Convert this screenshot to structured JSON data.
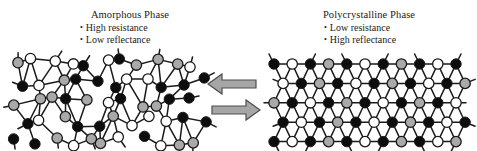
{
  "figure": {
    "background_color": "#ffffff"
  },
  "panels": {
    "amorphous": {
      "title": "Amorphous Phase",
      "bullets": [
        {
          "marker": "•",
          "label": "High resistance"
        },
        {
          "marker": "•",
          "label": "Low reflectance"
        }
      ],
      "structure_name": "amorphous-lattice",
      "order": "disordered"
    },
    "crystalline": {
      "title": "Polycrystalline Phase",
      "bullets": [
        {
          "marker": "•",
          "label": "Low resistance"
        },
        {
          "marker": "•",
          "label": "High reflectance"
        }
      ],
      "structure_name": "polycrystalline-lattice",
      "order": "ordered"
    }
  },
  "arrows": {
    "left": {
      "direction": "left",
      "meaning": "amorphization"
    },
    "right": {
      "direction": "right",
      "meaning": "crystallization"
    }
  },
  "colors": {
    "atom_dark": "#0d0d0d",
    "atom_light": "#ffffff",
    "atom_gray": "#a9a9a9",
    "bond": "#1a1a1a",
    "arrow_fill": "#a6a6a6",
    "arrow_stroke": "#4d4d4d",
    "text": "#1a1a1a"
  },
  "atom_legend": {
    "dark_label": "dark atom",
    "light_label": "light atom",
    "gray_label": "gray atom"
  },
  "chart_data": {
    "type": "diagram",
    "amorphous_atom_counts": {
      "dark": 28,
      "light": 18,
      "gray": 16
    },
    "crystalline_atom_counts": {
      "dark": 30,
      "light": 20,
      "gray": 15
    },
    "crystalline_rows": 5,
    "crystalline_columns": 11
  }
}
